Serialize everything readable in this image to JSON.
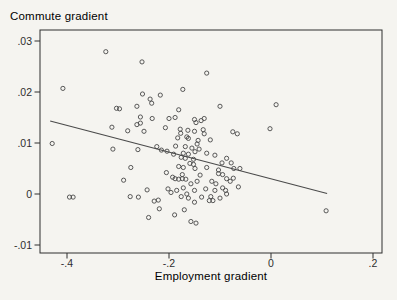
{
  "colors": {
    "background": "#f5f4f0",
    "ink": "#2e2e2e",
    "marker": "#474747",
    "fit_line": "#4a4a4a"
  },
  "chart_data": {
    "type": "scatter",
    "title": "Commute gradient",
    "xlabel": "Employment gradient",
    "ylabel": "",
    "xlim": [
      -0.453,
      0.218
    ],
    "ylim": [
      -0.0116,
      0.0322
    ],
    "xticks": [
      -0.4,
      -0.2,
      0,
      0.2
    ],
    "xtick_labels": [
      "-.4",
      "-.2",
      "0",
      ".2"
    ],
    "yticks": [
      0.03,
      0.02,
      0.01,
      0,
      -0.01
    ],
    "ytick_labels": [
      ".03",
      ".02",
      ".01",
      "0",
      "-.01"
    ],
    "grid": false,
    "legend": "none",
    "marker": "open-circle",
    "fit_line": {
      "x1": -0.433,
      "y1": 0.0143,
      "x2": 0.11,
      "y2": 0.0001
    },
    "points": [
      [
        -0.324,
        0.0279
      ],
      [
        -0.253,
        0.0259
      ],
      [
        -0.408,
        0.0207
      ],
      [
        -0.252,
        0.0196
      ],
      [
        -0.237,
        0.0186
      ],
      [
        -0.234,
        0.0178
      ],
      [
        -0.217,
        0.0194
      ],
      [
        -0.173,
        0.0205
      ],
      [
        -0.126,
        0.0237
      ],
      [
        0.01,
        0.0175
      ],
      [
        -0.303,
        0.0168
      ],
      [
        -0.297,
        0.0167
      ],
      [
        -0.263,
        0.0172
      ],
      [
        -0.181,
        0.0165
      ],
      [
        -0.1,
        0.0172
      ],
      [
        -0.256,
        0.0151
      ],
      [
        -0.233,
        0.0148
      ],
      [
        -0.2,
        0.0148
      ],
      [
        -0.188,
        0.015
      ],
      [
        -0.15,
        0.0146
      ],
      [
        -0.131,
        0.0148
      ],
      [
        -0.147,
        0.014
      ],
      [
        -0.137,
        0.0144
      ],
      [
        -0.256,
        0.0139
      ],
      [
        -0.312,
        0.0131
      ],
      [
        -0.281,
        0.0124
      ],
      [
        -0.263,
        0.0136
      ],
      [
        -0.249,
        0.0123
      ],
      [
        -0.207,
        0.013
      ],
      [
        -0.178,
        0.0127
      ],
      [
        -0.177,
        0.0119
      ],
      [
        -0.163,
        0.0125
      ],
      [
        -0.15,
        0.0123
      ],
      [
        -0.133,
        0.0126
      ],
      [
        -0.131,
        0.0118
      ],
      [
        -0.075,
        0.0122
      ],
      [
        -0.066,
        0.0118
      ],
      [
        -0.002,
        0.0128
      ],
      [
        -0.183,
        0.011
      ],
      [
        -0.165,
        0.0112
      ],
      [
        -0.162,
        0.0109
      ],
      [
        -0.119,
        0.0106
      ],
      [
        -0.429,
        0.0099
      ],
      [
        -0.31,
        0.0088
      ],
      [
        -0.261,
        0.0087
      ],
      [
        -0.224,
        0.0093
      ],
      [
        -0.215,
        0.0086
      ],
      [
        -0.204,
        0.0084
      ],
      [
        -0.187,
        0.0094
      ],
      [
        -0.168,
        0.0093
      ],
      [
        -0.155,
        0.009
      ],
      [
        -0.143,
        0.0105
      ],
      [
        -0.141,
        0.0088
      ],
      [
        -0.145,
        0.0098
      ],
      [
        -0.149,
        0.0083
      ],
      [
        -0.172,
        0.008
      ],
      [
        -0.162,
        0.0078
      ],
      [
        -0.126,
        0.008
      ],
      [
        -0.191,
        0.0078
      ],
      [
        -0.176,
        0.0072
      ],
      [
        -0.168,
        0.007
      ],
      [
        -0.152,
        0.0068
      ],
      [
        -0.11,
        0.0076
      ],
      [
        -0.087,
        0.007
      ],
      [
        -0.078,
        0.0061
      ],
      [
        -0.096,
        0.0061
      ],
      [
        -0.159,
        0.006
      ],
      [
        -0.152,
        0.0058
      ],
      [
        -0.181,
        0.0054
      ],
      [
        -0.172,
        0.0052
      ],
      [
        -0.149,
        0.005
      ],
      [
        -0.126,
        0.0052
      ],
      [
        -0.103,
        0.0047
      ],
      [
        -0.073,
        0.005
      ],
      [
        -0.061,
        0.005
      ],
      [
        -0.275,
        0.0052
      ],
      [
        -0.289,
        0.0027
      ],
      [
        -0.205,
        0.0042
      ],
      [
        -0.193,
        0.0033
      ],
      [
        -0.188,
        0.003
      ],
      [
        -0.181,
        0.0029
      ],
      [
        -0.174,
        0.0038
      ],
      [
        -0.174,
        0.003
      ],
      [
        -0.167,
        0.0029
      ],
      [
        -0.157,
        0.002
      ],
      [
        -0.145,
        0.0025
      ],
      [
        -0.139,
        0.0037
      ],
      [
        -0.116,
        0.0025
      ],
      [
        -0.108,
        0.002
      ],
      [
        -0.103,
        0.004
      ],
      [
        -0.095,
        0.0038
      ],
      [
        -0.087,
        0.003
      ],
      [
        -0.08,
        0.0025
      ],
      [
        -0.074,
        0.0031
      ],
      [
        -0.202,
        0.001
      ],
      [
        -0.185,
        0.0007
      ],
      [
        -0.172,
        0.0012
      ],
      [
        -0.15,
        0.0007
      ],
      [
        -0.128,
        0.001
      ],
      [
        -0.11,
        0.0007
      ],
      [
        -0.095,
        0.0012
      ],
      [
        -0.089,
        0.0007
      ],
      [
        -0.243,
        0.0008
      ],
      [
        -0.064,
        0.0014
      ],
      [
        -0.395,
        -0.0006
      ],
      [
        -0.388,
        -0.0006
      ],
      [
        -0.276,
        -0.0005
      ],
      [
        -0.26,
        -0.0006
      ],
      [
        -0.229,
        -0.0014
      ],
      [
        -0.221,
        -0.0012
      ],
      [
        -0.196,
        0.0003
      ],
      [
        -0.176,
        -0.0005
      ],
      [
        -0.165,
        0.0
      ],
      [
        -0.162,
        -0.0008
      ],
      [
        -0.15,
        -0.0016
      ],
      [
        -0.136,
        -0.0006
      ],
      [
        -0.121,
        -0.0013
      ],
      [
        -0.118,
        -0.0005
      ],
      [
        -0.114,
        -0.0013
      ],
      [
        -0.1,
        -0.0008
      ],
      [
        -0.087,
        0.0
      ],
      [
        -0.219,
        -0.0029
      ],
      [
        -0.189,
        -0.0041
      ],
      [
        -0.17,
        -0.0031
      ],
      [
        -0.24,
        -0.0046
      ],
      [
        -0.157,
        -0.0054
      ],
      [
        -0.147,
        -0.0057
      ],
      [
        0.108,
        -0.0033
      ]
    ]
  }
}
